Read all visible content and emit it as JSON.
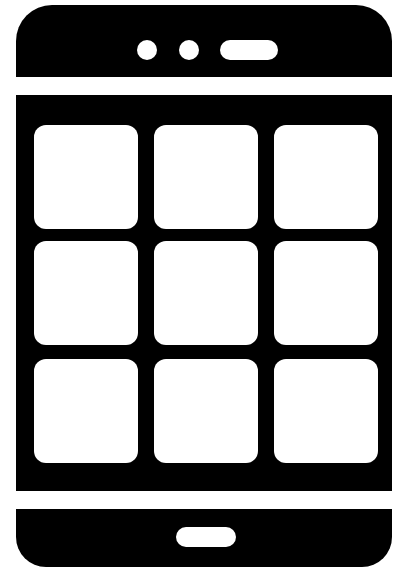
{
  "icon": {
    "type": "smartphone-app-grid",
    "colors": {
      "fill": "#000000",
      "background": "#ffffff"
    },
    "grid": {
      "rows": 3,
      "cols": 3
    },
    "top_bar": {
      "speaker_dots": 2,
      "speaker_pill": 1
    },
    "bottom_bar": {
      "home_button": 1
    }
  }
}
